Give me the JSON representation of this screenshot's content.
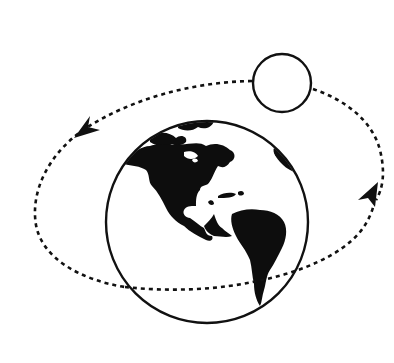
{
  "diagram": {
    "title": "Moon orbiting the Earth",
    "background": "#ffffff",
    "stroke_color": "#111111",
    "land_color": "#0d0d0d",
    "nodes": [
      {
        "id": "earth",
        "label": "Earth",
        "shape": "circle",
        "cx": 207,
        "cy": 222,
        "r": 101,
        "fill": "#ffffff",
        "detail": "Western hemisphere: North and South America"
      },
      {
        "id": "moon",
        "label": "Moon",
        "shape": "circle",
        "cx": 282,
        "cy": 83,
        "r": 29,
        "fill": "#ffffff"
      }
    ],
    "edges": [
      {
        "id": "orbit",
        "from": "moon",
        "to": "earth",
        "type": "orbit-path",
        "style": "dashed",
        "direction": "counter-clockwise (as viewed)",
        "arrowheads": 2
      }
    ],
    "arrowheads": [
      {
        "id": "arrow-left",
        "x": 80,
        "y": 130,
        "pointing": "down-left"
      },
      {
        "id": "arrow-right",
        "x": 375,
        "y": 190,
        "pointing": "up"
      }
    ]
  }
}
